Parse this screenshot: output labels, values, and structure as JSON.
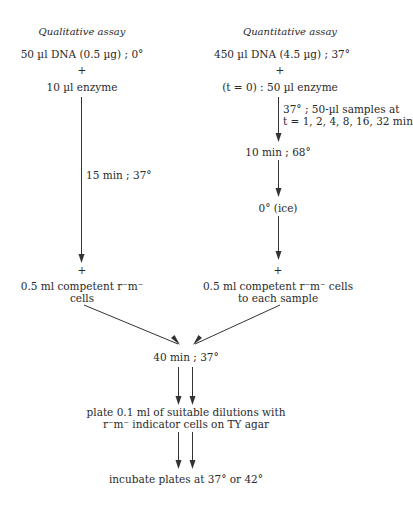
{
  "diagram": {
    "left_column": {
      "heading": "Qualitative assay",
      "step1": "50 µl DNA (0.5 µg) ; 0°",
      "plus1": "+",
      "step2": "10 µl enzyme",
      "arrow_label": "15 min ; 37°",
      "plus2": "+",
      "step3_line1": "0.5 ml competent r⁻m⁻",
      "step3_line2": "cells"
    },
    "right_column": {
      "heading": "Quantitative assay",
      "step1": "450 µl DNA (4.5 µg) ; 37°",
      "plus1": "+",
      "step2": "(t = 0) : 50 µl enzyme",
      "arrow_label_line1": "37° ; 50-µl samples at",
      "arrow_label_line2": "t = 1, 2, 4, 8, 16, 32 min",
      "step3": "10 min ; 68°",
      "step4": "0° (ice)",
      "plus2": "+",
      "step5_line1": "0.5 ml competent r⁻m⁻ cells",
      "step5_line2": "to each sample"
    },
    "merged": {
      "step1": "40 min ; 37°",
      "step2_line1": "plate 0.1 ml of suitable dilutions with",
      "step2_line2": "r⁻m⁻ indicator cells on TY agar",
      "step3": "incubate plates at 37° or 42°"
    },
    "colors": {
      "text": "#2a2a2a",
      "lines": "#333333",
      "background": "#ffffff"
    }
  }
}
